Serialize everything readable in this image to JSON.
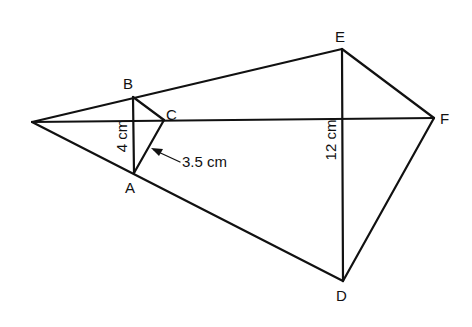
{
  "diagram": {
    "type": "geometry-similar-triangles",
    "points": {
      "O": {
        "x": 32,
        "y": 122,
        "label": ""
      },
      "A": {
        "x": 134,
        "y": 173,
        "label": "A"
      },
      "B": {
        "x": 133,
        "y": 97,
        "label": "B"
      },
      "C": {
        "x": 164,
        "y": 120,
        "label": "C"
      },
      "D": {
        "x": 343,
        "y": 281,
        "label": "D"
      },
      "E": {
        "x": 342,
        "y": 49,
        "label": "E"
      },
      "F": {
        "x": 434,
        "y": 118,
        "label": "F"
      }
    },
    "labels": {
      "A": "A",
      "B": "B",
      "C": "C",
      "D": "D",
      "E": "E",
      "F": "F"
    },
    "dimensions": {
      "ab": "4 cm",
      "ac": "3.5 cm",
      "de": "12 cm"
    },
    "colors": {
      "line": "#111111",
      "background": "#ffffff"
    }
  }
}
